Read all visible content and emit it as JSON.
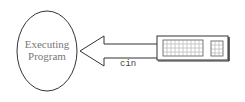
{
  "diagram": {
    "program": {
      "line1": "Executing",
      "line2": "Program"
    },
    "arrow_label": "cin",
    "keyboard": {
      "name": "keyboard"
    }
  }
}
